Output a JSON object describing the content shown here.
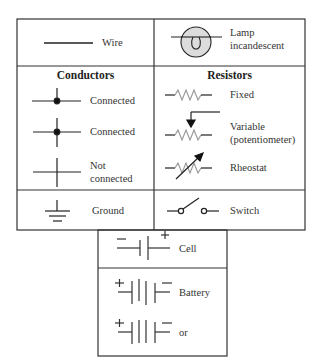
{
  "diagram": {
    "table": {
      "top_row": {
        "left": {
          "symbol": "wire-icon",
          "label": "Wire"
        },
        "right": {
          "symbol": "lamp-icon",
          "label_line1": "Lamp",
          "label_line2": "incandescent"
        }
      },
      "conductors": {
        "header": "Conductors",
        "items": [
          {
            "symbol": "junction-t-connected-icon",
            "label": "Connected"
          },
          {
            "symbol": "junction-cross-connected-icon",
            "label": "Connected"
          },
          {
            "symbol": "junction-not-connected-icon",
            "label_line1": "Not",
            "label_line2": "connected"
          }
        ]
      },
      "resistors": {
        "header": "Resistors",
        "items": [
          {
            "symbol": "resistor-fixed-icon",
            "label": "Fixed"
          },
          {
            "symbol": "resistor-variable-icon",
            "label_line1": "Variable",
            "label_line2": "(potentiometer)"
          },
          {
            "symbol": "rheostat-icon",
            "label": "Rheostat"
          }
        ]
      },
      "bottom_row": {
        "left": {
          "symbol": "ground-icon",
          "label": "Ground"
        },
        "right": {
          "symbol": "switch-icon",
          "label": "Switch"
        }
      }
    },
    "sources": {
      "cell": {
        "symbol": "cell-icon",
        "label": "Cell",
        "neg": "−",
        "pos": "+"
      },
      "battery": {
        "symbol": "battery-icon",
        "label": "Battery",
        "pos": "+"
      },
      "battery_alt": {
        "symbol": "battery-alt-icon",
        "label": "or",
        "pos": "+"
      }
    },
    "colors": {
      "line": "#2a2a2a",
      "resistor": "#9a9a9a",
      "lamp_fill": "#dcdcdc"
    }
  }
}
